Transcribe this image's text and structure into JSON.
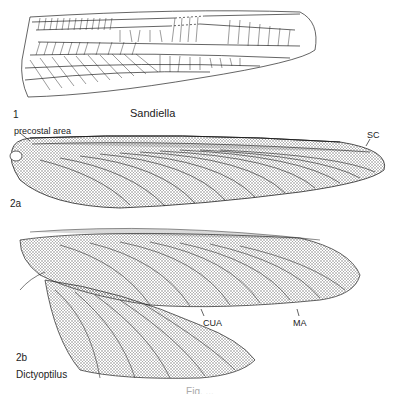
{
  "figure": {
    "panels": [
      {
        "id": "1",
        "number_label": "1",
        "taxon_label": "Sandiella",
        "annotations": []
      },
      {
        "id": "2a",
        "number_label": "2a",
        "annotations": [
          "precostal area",
          "SC"
        ]
      },
      {
        "id": "2b",
        "number_label": "2b",
        "taxon_label": "Dictyoptilus",
        "annotations": [
          "CUA",
          "MA"
        ]
      }
    ],
    "caption_truncated": "Fig. ..."
  },
  "colors": {
    "line": "#222222",
    "background": "#ffffff",
    "dense_venation": "#555555"
  }
}
